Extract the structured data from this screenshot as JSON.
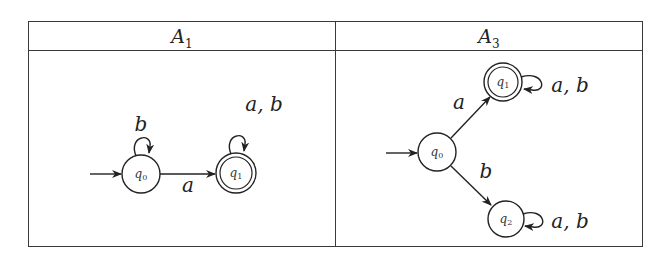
{
  "table": {
    "columns": [
      {
        "header_main": "A",
        "header_sub": "1"
      },
      {
        "header_main": "A",
        "header_sub": "3"
      }
    ]
  },
  "automata": [
    {
      "name": "A1",
      "states": [
        {
          "id": "q0",
          "main": "q",
          "sub": "0",
          "initial": true,
          "accepting": false
        },
        {
          "id": "q1",
          "main": "q",
          "sub": "1",
          "initial": false,
          "accepting": true
        }
      ],
      "transitions": [
        {
          "from": "q0",
          "to": "q0",
          "label": "b"
        },
        {
          "from": "q0",
          "to": "q1",
          "label": "a"
        },
        {
          "from": "q1",
          "to": "q1",
          "label": "a, b"
        }
      ]
    },
    {
      "name": "A3",
      "states": [
        {
          "id": "q0",
          "main": "q",
          "sub": "0",
          "initial": true,
          "accepting": false
        },
        {
          "id": "q1",
          "main": "q",
          "sub": "1",
          "initial": false,
          "accepting": true
        },
        {
          "id": "q2",
          "main": "q",
          "sub": "2",
          "initial": false,
          "accepting": false
        }
      ],
      "transitions": [
        {
          "from": "q0",
          "to": "q1",
          "label": "a"
        },
        {
          "from": "q0",
          "to": "q2",
          "label": "b"
        },
        {
          "from": "q1",
          "to": "q1",
          "label": "a, b"
        },
        {
          "from": "q2",
          "to": "q2",
          "label": "a, b"
        }
      ]
    }
  ]
}
